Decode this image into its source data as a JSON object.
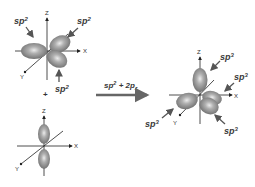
{
  "diagram": {
    "reactant_sp2": {
      "axes": {
        "z": "Z",
        "x": "X",
        "y": "Y"
      },
      "labels": [
        "sp",
        "sp",
        "sp"
      ],
      "superscript": "2"
    },
    "plus_sign": "+",
    "reactant_p": {
      "axes": {
        "z": "Z",
        "x": "X",
        "y": "Y"
      }
    },
    "arrow": {
      "label_base": "sp",
      "label_sup": "2",
      "label_mid": " + 2p",
      "label_sub": "z"
    },
    "product_sp3": {
      "axes": {
        "z": "Z",
        "x": "X",
        "y": "Y"
      },
      "labels": [
        "sp",
        "sp",
        "sp",
        "sp"
      ],
      "superscript": "3"
    },
    "colors": {
      "lobe_dark": "#6e6e6e",
      "lobe_light": "#e8e8e8",
      "axis": "#222222",
      "arrow": "#555555"
    }
  }
}
